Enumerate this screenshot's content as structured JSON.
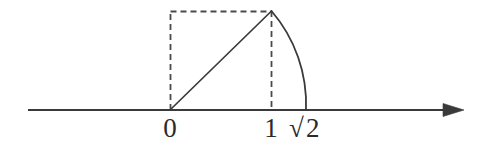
{
  "figure": {
    "background_color": "#ffffff",
    "stroke_color": "#3a3a3a",
    "axis_color": "#3a3a3a",
    "label_color": "#2a2a2a",
    "width": 485,
    "height": 144
  },
  "axis": {
    "name": "number-line",
    "y": 110,
    "x_start": 28,
    "x_end": 462,
    "has_arrowhead_right": true,
    "arrow_tip_x": 462
  },
  "scale": {
    "origin_x": 170,
    "unit_px": 101,
    "value_at_origin": 0,
    "value_at_unit": 1
  },
  "labels": [
    {
      "id": "label-zero",
      "text": "0",
      "x": 170,
      "y": 137,
      "value": 0
    },
    {
      "id": "label-one",
      "text": "1",
      "x": 271,
      "y": 137,
      "value": 1
    },
    {
      "id": "label-sqrt2",
      "radical": "√",
      "text": "2",
      "x": 291,
      "y": 137,
      "value": 1.41421356
    }
  ],
  "square": {
    "name": "unit-square-dashed",
    "style": "dashed",
    "left_x": 170,
    "right_x": 271,
    "top_y": 11,
    "bottom_y": 110,
    "dash_pattern": "6,4",
    "visible_sides": [
      "left",
      "top",
      "right"
    ]
  },
  "diagonal": {
    "name": "unit-square-diagonal",
    "style": "solid",
    "from_x": 170,
    "from_y": 110,
    "to_x": 271,
    "to_y": 11,
    "length_value": "√2"
  },
  "arc": {
    "name": "compass-arc",
    "style": "solid",
    "center_x": 170,
    "center_y": 110,
    "radius": 143,
    "start_x": 271,
    "start_y": 11,
    "end_x": 306,
    "end_y": 110,
    "sweep": "clockwise"
  }
}
